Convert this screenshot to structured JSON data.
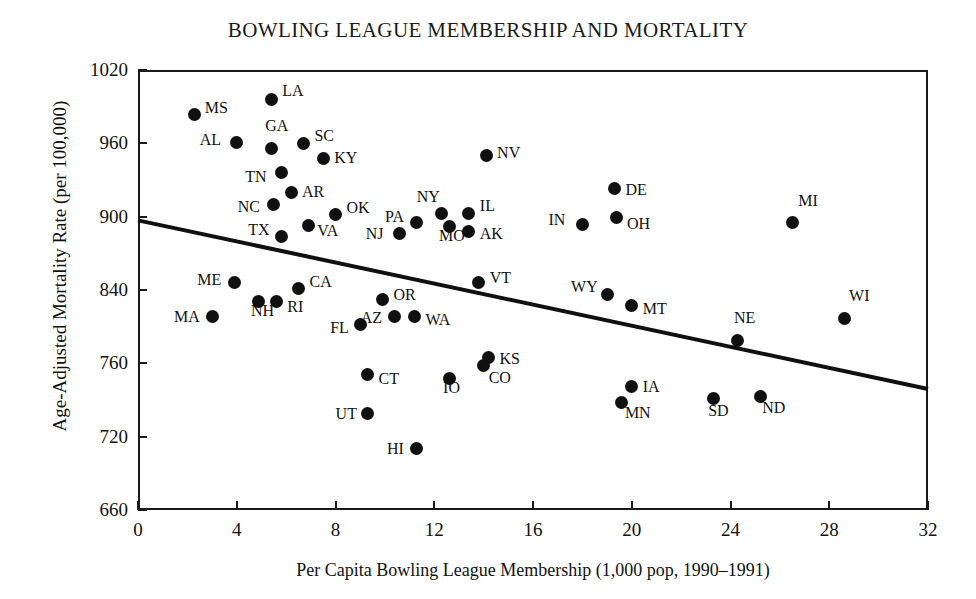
{
  "chart_data": {
    "type": "scatter",
    "title": "BOWLING LEAGUE MEMBERSHIP AND MORTALITY",
    "xlabel": "Per Capita Bowling League Membership (1,000 pop, 1990–1991)",
    "ylabel": "Age-Adjusted Mortality Rate (per 100,000)",
    "xlim": [
      0,
      32
    ],
    "ylim": [
      660,
      1020
    ],
    "grid": false,
    "legend": "none",
    "xticks": [
      "0",
      "4",
      "8",
      "12",
      "16",
      "20",
      "24",
      "28",
      "32"
    ],
    "xtick_values": [
      0,
      4,
      8,
      12,
      16,
      20,
      24,
      28,
      32
    ],
    "yticks": [
      "1020",
      "960",
      "900",
      "840",
      "760",
      "720",
      "660"
    ],
    "ytick_values": [
      1020,
      960,
      900,
      840,
      780,
      720,
      660
    ],
    "point_label_field": "state",
    "trendline": {
      "x0": 0,
      "y0": 897,
      "x1": 32,
      "y1": 759,
      "style": "solid",
      "color": "#101010",
      "width_px": 4
    },
    "points": [
      {
        "state": "MS",
        "x": 2.3,
        "y": 984,
        "lx": 10,
        "ly": -6
      },
      {
        "state": "LA",
        "x": 5.4,
        "y": 996,
        "lx": 11,
        "ly": -8
      },
      {
        "state": "AL",
        "x": 4.0,
        "y": 961,
        "lx": -37,
        "ly": -2
      },
      {
        "state": "GA",
        "x": 5.4,
        "y": 956,
        "lx": -6,
        "ly": -22
      },
      {
        "state": "SC",
        "x": 6.7,
        "y": 960,
        "lx": 11,
        "ly": -7
      },
      {
        "state": "TN",
        "x": 5.8,
        "y": 936,
        "lx": -36,
        "ly": 4
      },
      {
        "state": "KY",
        "x": 7.5,
        "y": 948,
        "lx": 11,
        "ly": 0
      },
      {
        "state": "NV",
        "x": 14.1,
        "y": 950,
        "lx": 11,
        "ly": -3
      },
      {
        "state": "AR",
        "x": 6.2,
        "y": 920,
        "lx": 11,
        "ly": 0
      },
      {
        "state": "NC",
        "x": 5.5,
        "y": 910,
        "lx": -36,
        "ly": 3
      },
      {
        "state": "OK",
        "x": 8.0,
        "y": 902,
        "lx": 11,
        "ly": -6
      },
      {
        "state": "VA",
        "x": 6.9,
        "y": 893,
        "lx": 9,
        "ly": 6
      },
      {
        "state": "TX",
        "x": 5.8,
        "y": 884,
        "lx": -33,
        "ly": -6
      },
      {
        "state": "PA",
        "x": 11.3,
        "y": 895,
        "lx": -32,
        "ly": -6
      },
      {
        "state": "NY",
        "x": 12.3,
        "y": 903,
        "lx": -25,
        "ly": -16
      },
      {
        "state": "IL",
        "x": 13.4,
        "y": 903,
        "lx": 11,
        "ly": -7
      },
      {
        "state": "NJ",
        "x": 10.6,
        "y": 886,
        "lx": -34,
        "ly": 0
      },
      {
        "state": "MO",
        "x": 12.6,
        "y": 892,
        "lx": -10,
        "ly": 10
      },
      {
        "state": "AK",
        "x": 13.4,
        "y": 888,
        "lx": 11,
        "ly": 3
      },
      {
        "state": "IN",
        "x": 18.0,
        "y": 894,
        "lx": -34,
        "ly": -4
      },
      {
        "state": "DE",
        "x": 19.3,
        "y": 923,
        "lx": 11,
        "ly": 1
      },
      {
        "state": "OH",
        "x": 19.4,
        "y": 899,
        "lx": 10,
        "ly": 6
      },
      {
        "state": "MI",
        "x": 26.5,
        "y": 895,
        "lx": 6,
        "ly": -22
      },
      {
        "state": "VT",
        "x": 13.8,
        "y": 846,
        "lx": 11,
        "ly": -5
      },
      {
        "state": "ME",
        "x": 3.9,
        "y": 846,
        "lx": -37,
        "ly": -3
      },
      {
        "state": "CA",
        "x": 6.5,
        "y": 841,
        "lx": 11,
        "ly": -7
      },
      {
        "state": "RI",
        "x": 5.6,
        "y": 831,
        "lx": 11,
        "ly": 6
      },
      {
        "state": "NH",
        "x": 4.9,
        "y": 831,
        "lx": -8,
        "ly": 10
      },
      {
        "state": "MA",
        "x": 3.0,
        "y": 818,
        "lx": -38,
        "ly": 0
      },
      {
        "state": "WY",
        "x": 19.0,
        "y": 836,
        "lx": -36,
        "ly": -8
      },
      {
        "state": "MT",
        "x": 20.0,
        "y": 827,
        "lx": 11,
        "ly": 3
      },
      {
        "state": "OR",
        "x": 9.9,
        "y": 832,
        "lx": 11,
        "ly": -5
      },
      {
        "state": "AZ",
        "x": 10.4,
        "y": 818,
        "lx": -34,
        "ly": 1
      },
      {
        "state": "WA",
        "x": 11.2,
        "y": 818,
        "lx": 11,
        "ly": 3
      },
      {
        "state": "FL",
        "x": 9.0,
        "y": 812,
        "lx": -30,
        "ly": 4
      },
      {
        "state": "NE",
        "x": 24.3,
        "y": 799,
        "lx": -4,
        "ly": -22
      },
      {
        "state": "WI",
        "x": 28.6,
        "y": 817,
        "lx": 5,
        "ly": -22
      },
      {
        "state": "KS",
        "x": 14.2,
        "y": 785,
        "lx": 11,
        "ly": 2
      },
      {
        "state": "CT",
        "x": 9.3,
        "y": 771,
        "lx": 11,
        "ly": 5
      },
      {
        "state": "IO",
        "x": 12.6,
        "y": 768,
        "lx": -6,
        "ly": 10
      },
      {
        "state": "CO",
        "x": 14.0,
        "y": 778,
        "lx": 5,
        "ly": 12
      },
      {
        "state": "IA",
        "x": 20.0,
        "y": 761,
        "lx": 11,
        "ly": 0
      },
      {
        "state": "MN",
        "x": 19.6,
        "y": 748,
        "lx": 3,
        "ly": 11
      },
      {
        "state": "SD",
        "x": 23.3,
        "y": 751,
        "lx": -5,
        "ly": 12
      },
      {
        "state": "ND",
        "x": 25.2,
        "y": 753,
        "lx": 2,
        "ly": 12
      },
      {
        "state": "UT",
        "x": 9.3,
        "y": 739,
        "lx": -32,
        "ly": 1
      },
      {
        "state": "HI",
        "x": 11.3,
        "y": 710,
        "lx": -30,
        "ly": 0
      }
    ]
  }
}
